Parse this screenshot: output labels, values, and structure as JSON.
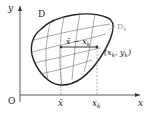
{
  "diagram": {
    "axes": {
      "y_label": "y",
      "x_label": "x",
      "origin_label": "O"
    },
    "region_label": "D",
    "subregion_label": "D",
    "subregion_subscript": "k",
    "segment_label_main": "x̄ − x",
    "segment_label_sub": "k",
    "point_label": "(x",
    "point_label_sub1": "k",
    "point_label_mid": ", y",
    "point_label_sub2": "k",
    "point_label_end": ")",
    "x_ticks": [
      {
        "main": "x̄",
        "sub": ""
      },
      {
        "main": "x",
        "sub": "k"
      }
    ],
    "colors": {
      "outline": "#222222",
      "grid": "#444444",
      "segment": "#333333",
      "dashed": "#777777",
      "subregion_label": "#999999"
    }
  }
}
